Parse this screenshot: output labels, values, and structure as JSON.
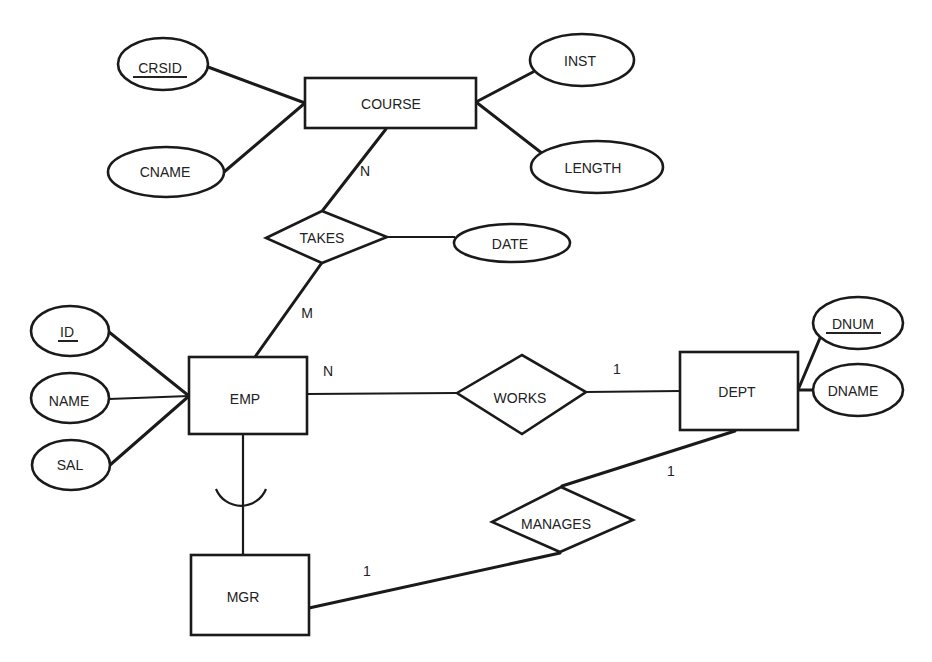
{
  "diagram": {
    "type": "entity-relationship",
    "entities": [
      {
        "id": "course",
        "label": "COURSE"
      },
      {
        "id": "emp",
        "label": "EMP"
      },
      {
        "id": "dept",
        "label": "DEPT"
      },
      {
        "id": "mgr",
        "label": "MGR"
      }
    ],
    "relationships": [
      {
        "id": "takes",
        "label": "TAKES"
      },
      {
        "id": "works",
        "label": "WORKS"
      },
      {
        "id": "manages",
        "label": "MANAGES"
      }
    ],
    "attributes": [
      {
        "id": "crsid",
        "label": "CRSID",
        "owner": "course",
        "key": true
      },
      {
        "id": "cname",
        "label": "CNAME",
        "owner": "course",
        "key": false
      },
      {
        "id": "inst",
        "label": "INST",
        "owner": "course",
        "key": false
      },
      {
        "id": "length",
        "label": "LENGTH",
        "owner": "course",
        "key": false
      },
      {
        "id": "date",
        "label": "DATE",
        "owner": "takes",
        "key": false
      },
      {
        "id": "id",
        "label": "ID",
        "owner": "emp",
        "key": true
      },
      {
        "id": "name",
        "label": "NAME",
        "owner": "emp",
        "key": false
      },
      {
        "id": "sal",
        "label": "SAL",
        "owner": "emp",
        "key": false
      },
      {
        "id": "dnum",
        "label": "DNUM",
        "owner": "dept",
        "key": true
      },
      {
        "id": "dname",
        "label": "DNAME",
        "owner": "dept",
        "key": false
      }
    ],
    "cardinalities": {
      "course_takes": "N",
      "emp_takes": "M",
      "emp_works": "N",
      "dept_works": "1",
      "dept_manages": "1",
      "mgr_manages": "1"
    },
    "subclass": {
      "parent": "EMP",
      "child": "MGR",
      "symbol": "subset-arc"
    }
  }
}
